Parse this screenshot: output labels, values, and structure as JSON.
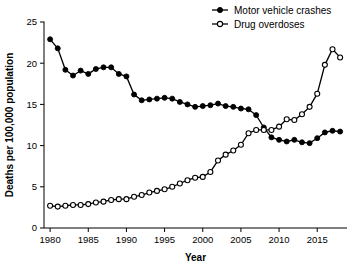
{
  "chart_data": {
    "type": "line",
    "title": "",
    "xlabel": "Year",
    "ylabel": "Deaths per 100,000 population",
    "xlim": [
      1979.2,
      2018.9
    ],
    "ylim": [
      0,
      25
    ],
    "grid": false,
    "legend_position": "top-right",
    "x_ticks": [
      1980,
      1985,
      1990,
      1995,
      2000,
      2005,
      2010,
      2015
    ],
    "x_tick_labels": [
      "1980",
      "1985",
      "1990",
      "1995",
      "2000",
      "2005",
      "2010",
      "2015"
    ],
    "y_ticks": [
      0,
      5,
      10,
      15,
      20,
      25
    ],
    "y_tick_labels": [
      "0",
      "5",
      "10",
      "15",
      "20",
      "25"
    ],
    "x": [
      1980,
      1981,
      1982,
      1983,
      1984,
      1985,
      1986,
      1987,
      1988,
      1989,
      1990,
      1991,
      1992,
      1993,
      1994,
      1995,
      1996,
      1997,
      1998,
      1999,
      2000,
      2001,
      2002,
      2003,
      2004,
      2005,
      2006,
      2007,
      2008,
      2009,
      2010,
      2011,
      2012,
      2013,
      2014,
      2015,
      2016,
      2017,
      2018
    ],
    "series": [
      {
        "name": "Motor vehicle crashes",
        "marker": "filled-circle",
        "color": "#000000",
        "values": [
          22.9,
          21.8,
          19.2,
          18.5,
          19.1,
          18.7,
          19.3,
          19.5,
          19.5,
          18.7,
          18.4,
          16.2,
          15.5,
          15.6,
          15.7,
          15.8,
          15.7,
          15.3,
          15.0,
          14.7,
          14.8,
          14.9,
          15.1,
          14.8,
          14.7,
          14.5,
          14.4,
          13.7,
          12.2,
          11.0,
          10.7,
          10.5,
          10.7,
          10.4,
          10.3,
          10.9,
          11.6,
          11.8,
          11.7
        ]
      },
      {
        "name": "Drug overdoses",
        "marker": "open-circle",
        "color": "#000000",
        "values": [
          2.7,
          2.6,
          2.7,
          2.8,
          2.8,
          2.9,
          3.1,
          3.2,
          3.4,
          3.5,
          3.5,
          3.8,
          4.0,
          4.3,
          4.5,
          4.7,
          5.0,
          5.4,
          5.8,
          6.1,
          6.2,
          6.8,
          8.2,
          8.9,
          9.4,
          10.1,
          11.5,
          11.9,
          11.9,
          11.9,
          12.3,
          13.2,
          13.1,
          13.8,
          14.7,
          16.3,
          19.8,
          21.7,
          20.7
        ]
      }
    ]
  },
  "legend": {
    "items": [
      {
        "label": "Motor vehicle crashes",
        "marker": "filled-circle"
      },
      {
        "label": "Drug overdoses",
        "marker": "open-circle"
      }
    ]
  },
  "axes": {
    "x_title": "Year",
    "y_title": "Deaths per 100,000 population"
  }
}
